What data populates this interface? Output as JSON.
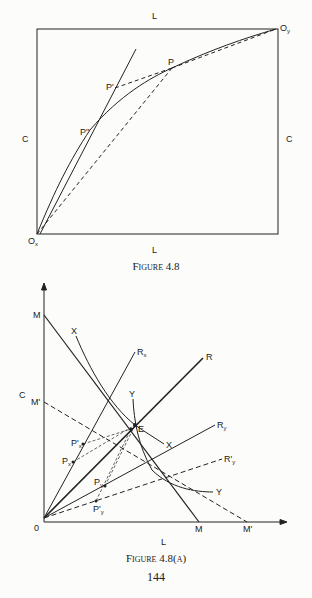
{
  "figure1": {
    "caption": "Figure 4.8",
    "labels": {
      "top_L": "L",
      "bottom_L": "L",
      "left_C": "C",
      "right_C": "C",
      "origin_x": "O",
      "origin_x_sub": "x",
      "origin_y": "O",
      "origin_y_sub": "y",
      "P": "P",
      "P_prime": "P'",
      "P_double_prime": "P''"
    }
  },
  "figure2": {
    "caption": "Figure 4.8(a)",
    "labels": {
      "M_top": "M",
      "C": "C",
      "M_prime_left": "M'",
      "X_top": "X",
      "X_right": "X",
      "Y_top": "Y",
      "Y_right": "Y",
      "R": "R",
      "Rx": "R",
      "Rx_sub": "x",
      "Ry": "R",
      "Ry_sub": "y",
      "Ry_prime": "R'",
      "Ry_prime_sub": "y",
      "E": "E",
      "Px_prime": "P'",
      "Px_prime_sub": "x",
      "Px": "P",
      "Px_sub": "x",
      "Py": "P",
      "Py_sub": "y",
      "Py_prime": "P'",
      "Py_prime_sub": "y",
      "origin": "0",
      "M_bottom": "M",
      "M_prime_bottom": "M'",
      "L": "L"
    }
  },
  "page_number": "144"
}
